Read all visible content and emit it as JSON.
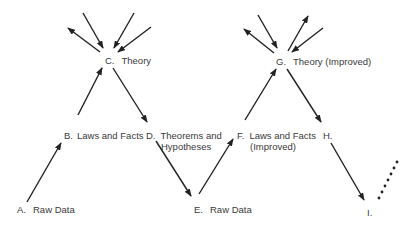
{
  "nodes": {
    "A": {
      "letter": "A.",
      "text": "Raw Data"
    },
    "B": {
      "letter": "B.",
      "text": "Laws and Facts"
    },
    "C": {
      "letter": "C.",
      "text": "Theory"
    },
    "D": {
      "letter": "D.",
      "text": "Theorems and",
      "text2": "Hypotheses"
    },
    "E": {
      "letter": "E.",
      "text": "Raw Data"
    },
    "F": {
      "letter": "F.",
      "text": "Laws and Facts",
      "text2": "(Improved)"
    },
    "G": {
      "letter": "G.",
      "text": "Theory (Improved)"
    },
    "H": {
      "letter": "H.",
      "text": ""
    },
    "I": {
      "letter": "I.",
      "text": ""
    }
  },
  "edges": [
    {
      "from": "A",
      "to": "B"
    },
    {
      "from": "B",
      "to": "C"
    },
    {
      "from": "C",
      "to": "D"
    },
    {
      "from": "D",
      "to": "E"
    },
    {
      "from": "E",
      "to": "F"
    },
    {
      "from": "F",
      "to": "G"
    },
    {
      "from": "G",
      "to": "H"
    },
    {
      "from": "H",
      "to": "I"
    },
    {
      "from": "I",
      "to": "continuation",
      "style": "dotted"
    }
  ],
  "colors": {
    "line": "#222222",
    "text": "#3a3a3a",
    "background": "#ffffff"
  }
}
